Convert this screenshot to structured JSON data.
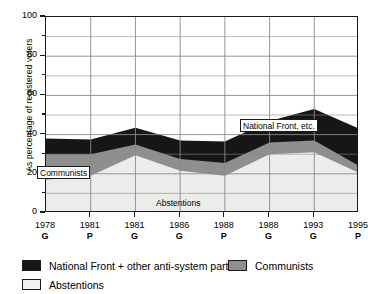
{
  "chart_data": {
    "type": "area",
    "title": "",
    "subtitle": "",
    "xlabel": "",
    "ylabel": "As percentage of registered voters",
    "ylim": [
      0,
      100
    ],
    "grid": true,
    "stacked": true,
    "legend_position": "bottom-left",
    "categories": [
      "1978 G",
      "1981 P",
      "1981 G",
      "1986 G",
      "1988 P",
      "1988 G",
      "1993 G",
      "1995 P"
    ],
    "x_years": [
      "1978",
      "1981",
      "1981",
      "1986",
      "1988",
      "1988",
      "1993",
      "1995"
    ],
    "x_types": [
      "G",
      "P",
      "G",
      "G",
      "P",
      "G",
      "G",
      "P"
    ],
    "y_ticks_major": [
      0,
      20,
      40,
      60,
      80,
      100
    ],
    "y_ticks_minor": [
      10,
      30,
      50,
      70,
      90
    ],
    "series": [
      {
        "name": "Abstentions",
        "color": "#ececea",
        "values": [
          17,
          19,
          29.5,
          21.5,
          19,
          30,
          31,
          20.5
        ]
      },
      {
        "name": "Communists",
        "color": "#8f8f8f",
        "values": [
          13,
          11,
          5.5,
          6,
          6.5,
          6,
          6,
          3.5
        ]
      },
      {
        "name": "National Front + other anti-system parties",
        "color": "#161616",
        "values": [
          8,
          7.5,
          8.5,
          9.5,
          11,
          11,
          16,
          19
        ]
      }
    ],
    "cumulative_tops": {
      "abstentions": [
        17,
        19,
        29.5,
        21.5,
        19,
        30,
        31,
        20.5
      ],
      "communists": [
        30,
        30,
        35,
        27.5,
        25.5,
        36,
        37,
        24
      ],
      "national_front": [
        38,
        37.5,
        43.5,
        37,
        36.5,
        47,
        53,
        43
      ]
    },
    "annotations": [
      {
        "text": "National Front, etc.",
        "boxed": true
      },
      {
        "text": "Communists",
        "boxed": true
      },
      {
        "text": "Abstentions",
        "boxed": false
      }
    ]
  },
  "axis": {
    "y_title": "As percentage of registered voters",
    "y_labels": [
      "100",
      "80",
      "60",
      "40",
      "20",
      "0"
    ],
    "x_labels": [
      {
        "year": "1978",
        "type": "G"
      },
      {
        "year": "1981",
        "type": "P"
      },
      {
        "year": "1981",
        "type": "G"
      },
      {
        "year": "1986",
        "type": "G"
      },
      {
        "year": "1988",
        "type": "P"
      },
      {
        "year": "1988",
        "type": "G"
      },
      {
        "year": "1993",
        "type": "G"
      },
      {
        "year": "1995",
        "type": "P"
      }
    ]
  },
  "annotations": {
    "national_front": "National Front, etc.",
    "communists": "Communists",
    "abstentions": "Abstentions"
  },
  "legend": {
    "items": [
      {
        "label": "National Front + other anti-system parties",
        "color": "#161616"
      },
      {
        "label": "Communists",
        "color": "#8f8f8f"
      },
      {
        "label": "Abstentions",
        "color": "#f2f2f0"
      }
    ]
  },
  "colors": {
    "national_front": "#161616",
    "communists": "#8f8f8f",
    "abstentions": "#ececea",
    "grid": "#8a8a8a",
    "axis": "#1a1a1a",
    "background": "#ffffff"
  }
}
